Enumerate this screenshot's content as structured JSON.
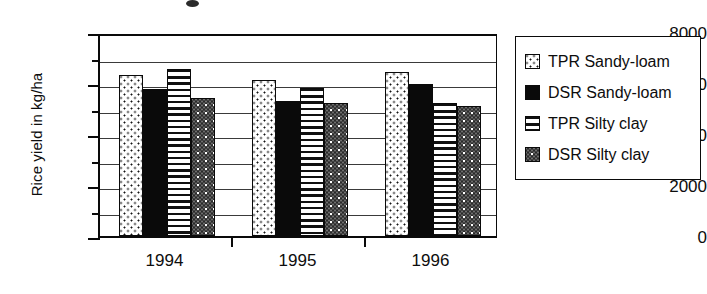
{
  "chart_data": {
    "type": "bar",
    "title": "",
    "xlabel": "",
    "ylabel": "Rice yield in kg/ha",
    "categories": [
      "1994",
      "1995",
      "1996"
    ],
    "ylim": [
      0,
      8000
    ],
    "ytick_labels": [
      "8000",
      "6000",
      "4000",
      "2000",
      "0"
    ],
    "ytick_values": [
      8000,
      6000,
      4000,
      2000,
      0
    ],
    "minor_tick_values": [
      7000,
      5000,
      3000,
      1000
    ],
    "gridlines": [
      7000,
      6000,
      5000,
      4000,
      3000,
      2000,
      1000
    ],
    "grid": true,
    "legend_position": "right",
    "series": [
      {
        "name": "TPR Sandy-loam",
        "pattern": "dotted",
        "values": [
          6300,
          6100,
          6450
        ]
      },
      {
        "name": "DSR Sandy-loam",
        "pattern": "solid-black",
        "values": [
          5750,
          5300,
          5950
        ]
      },
      {
        "name": "TPR Silty clay",
        "pattern": "horizontal-lines",
        "values": [
          6550,
          5800,
          5200
        ]
      },
      {
        "name": "DSR Silty clay",
        "pattern": "checkered-gray",
        "values": [
          5400,
          5200,
          5100
        ]
      }
    ]
  },
  "legend": {
    "items": [
      {
        "label": "TPR Sandy-loam",
        "swatch": "dotted-swatch"
      },
      {
        "label": "DSR Sandy-loam",
        "swatch": "solid-black-swatch"
      },
      {
        "label": "TPR Silty clay",
        "swatch": "horizontal-lines-swatch"
      },
      {
        "label": "DSR Silty clay",
        "swatch": "checkered-gray-swatch"
      }
    ]
  },
  "colors": {
    "axis": "#0a0a0a",
    "grid": "#3a3a3a",
    "bar_outline": "#0a0a0a",
    "solid_fill": "#0a0a0a",
    "checker_fill": "#6e6e6e",
    "background": "#ffffff"
  }
}
